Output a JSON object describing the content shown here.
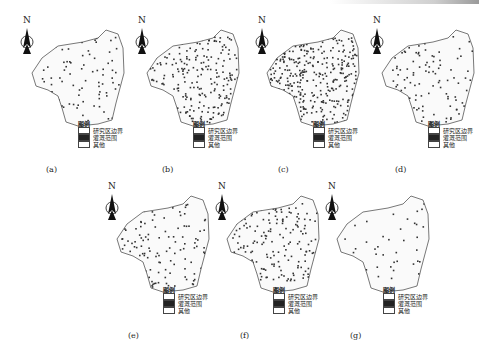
{
  "figure": {
    "panels": [
      {
        "label": "(a)",
        "density": 0.18
      },
      {
        "label": "(b)",
        "density": 0.45
      },
      {
        "label": "(c)",
        "density": 0.65
      },
      {
        "label": "(d)",
        "density": 0.2
      },
      {
        "label": "(e)",
        "density": 0.25
      },
      {
        "label": "(f)",
        "density": 0.35
      },
      {
        "label": "(g)",
        "density": 0.08
      }
    ],
    "north_label": "N",
    "legend": {
      "title": "图例",
      "items": [
        {
          "label": "研究区边界",
          "swatch": "#ffffff"
        },
        {
          "label": "灌溉范围",
          "swatch": "#222222"
        },
        {
          "label": "其他",
          "swatch": "#ffffff"
        }
      ]
    }
  }
}
